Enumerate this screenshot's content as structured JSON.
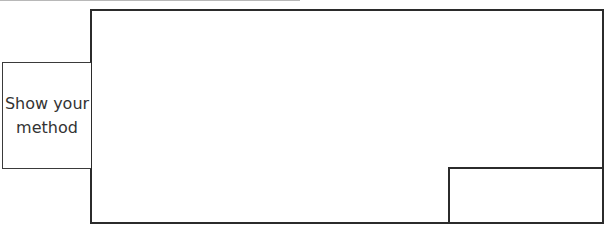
{
  "worksheet": {
    "method_box": {
      "label_line1": "Show your",
      "label_line2": "method"
    },
    "working_area": {
      "content": ""
    },
    "answer_box": {
      "content": ""
    }
  }
}
